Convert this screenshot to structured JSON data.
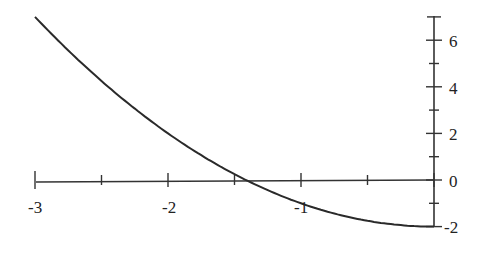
{
  "chart_data": {
    "type": "line",
    "title": "",
    "xlabel": "",
    "ylabel": "",
    "function": "y = x^2 - 2",
    "xlim": [
      -3,
      0
    ],
    "ylim": [
      -2,
      7
    ],
    "grid": false,
    "legend": null,
    "x_ticks": [
      -3,
      -2.5,
      -2,
      -1.5,
      -1,
      -0.5,
      0
    ],
    "x_tick_labels": [
      "-3",
      "-2",
      "-1"
    ],
    "y_ticks": [
      -2,
      -1,
      0,
      1,
      2,
      3,
      4,
      5,
      6,
      7
    ],
    "y_tick_labels": [
      "6",
      "4",
      "2",
      "0",
      "-2"
    ],
    "series": [
      {
        "name": "f(x)",
        "x": [
          -3,
          -2.5,
          -2,
          -1.5,
          -1.414,
          -1,
          -0.5,
          0
        ],
        "y": [
          7,
          4.25,
          2,
          0.25,
          0,
          -1,
          -1.75,
          -2
        ]
      }
    ]
  },
  "labels": {
    "x": [
      "-3",
      "-2",
      "-1"
    ],
    "y": [
      "6",
      "4",
      "2",
      "0",
      "-2"
    ]
  }
}
